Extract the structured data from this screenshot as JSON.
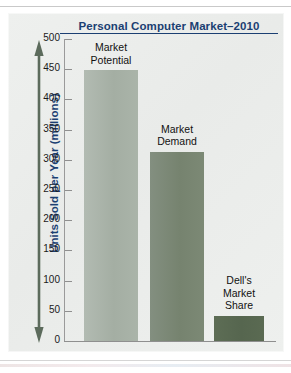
{
  "chart_data": {
    "type": "bar",
    "title": "Personal Computer Market–2010",
    "xlabel": "",
    "ylabel": "Units Sold per Year (millions)",
    "ylim": [
      0,
      500
    ],
    "ytick_interval": 50,
    "yticks": [
      "500",
      "450",
      "400",
      "350",
      "300",
      "250",
      "200",
      "150",
      "100",
      "50",
      "0"
    ],
    "grid": false,
    "legend": "none",
    "categories": [
      "Market Potential",
      "Market Demand",
      "Dell's Market Share"
    ],
    "values": [
      448,
      313,
      42
    ],
    "bars": [
      {
        "key": "market-potential",
        "label": "Market\nPotential",
        "value": 448,
        "color": "#a4aea3"
      },
      {
        "key": "market-demand",
        "label": "Market\nDemand",
        "value": 313,
        "color": "#76836f"
      },
      {
        "key": "dells-market-share",
        "label": "Dell's\nMarket\nShare",
        "value": 42,
        "color": "#56664f"
      }
    ]
  },
  "colors": {
    "title_blue": "#1b3f72",
    "axis_line": "#8f8f8f",
    "panel_background": "#eceeec",
    "arrow": "#5c6b5c"
  }
}
